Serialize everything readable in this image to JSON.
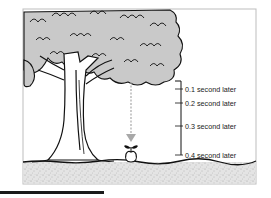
{
  "figure": {
    "colors": {
      "foliage": "#c9c9c9",
      "ground": "#dcdcdc",
      "ink": "#111111",
      "arrow": "#a8a8a8",
      "frame": "#bdbdbd"
    },
    "time_markers": [
      {
        "label": "0.1 second later",
        "time_s": 0.1
      },
      {
        "label": "0.2 second later",
        "time_s": 0.2
      },
      {
        "label": "0.3 second later",
        "time_s": 0.3
      },
      {
        "label": "0.4 second later",
        "time_s": 0.4
      }
    ],
    "icons": {
      "tree": "tree-icon",
      "apple": "apple-icon",
      "arrow": "down-arrow-icon"
    }
  }
}
